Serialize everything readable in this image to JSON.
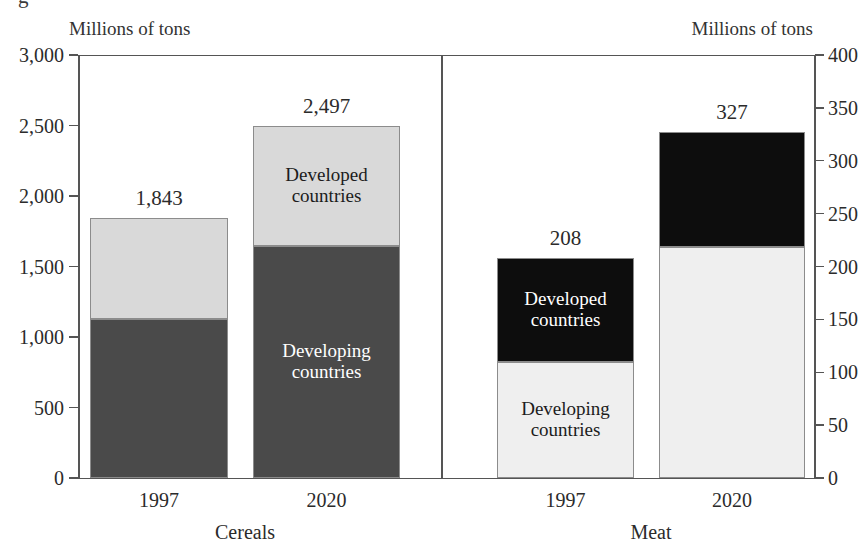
{
  "figure": {
    "top_cropped_text": "g",
    "background": "#ffffff"
  },
  "axes": {
    "left": {
      "unit_caption": "Millions of tons",
      "min": 0,
      "max": 3000,
      "ticks": [
        0,
        500,
        1000,
        1500,
        2000,
        2500,
        3000
      ],
      "tick_labels": [
        "0",
        "500",
        "1,000",
        "1,500",
        "2,000",
        "2,500",
        "3,000"
      ]
    },
    "right": {
      "unit_caption": "Millions of tons",
      "min": 0,
      "max": 400,
      "ticks": [
        0,
        50,
        100,
        150,
        200,
        250,
        300,
        350,
        400
      ],
      "tick_labels": [
        "0",
        "50",
        "100",
        "150",
        "200",
        "250",
        "300",
        "350",
        "400"
      ]
    }
  },
  "colors": {
    "cereals_developing": "#4a4a4a",
    "cereals_developed": "#d9d9d9",
    "meat_developing": "#efefef",
    "meat_developed": "#0d0d0d",
    "axis": "#555555",
    "text": "#2b2b2b"
  },
  "chart_data": {
    "type": "bar",
    "subtype": "stacked",
    "title": "",
    "xlabel": "",
    "ylabel": "Millions of tons",
    "panels": [
      {
        "name": "Cereals",
        "group_label": "Cereals",
        "axis": "left",
        "ylim": [
          0,
          3000
        ],
        "categories": [
          "1997",
          "2020"
        ],
        "totals": [
          1843,
          2497
        ],
        "total_labels": [
          "1,843",
          "2,497"
        ],
        "series": [
          {
            "name": "Developing countries",
            "values": [
              1130,
              1645
            ],
            "color": "#4a4a4a",
            "label_color": "#ffffff"
          },
          {
            "name": "Developed countries",
            "values": [
              713,
              852
            ],
            "color": "#d9d9d9",
            "label_color": "#1c1c1c"
          }
        ],
        "annotations": [
          {
            "text_line1": "Developed",
            "text_line2": "countries",
            "on_category": "2020",
            "on_series": "Developed countries"
          },
          {
            "text_line1": "Developing",
            "text_line2": "countries",
            "on_category": "2020",
            "on_series": "Developing countries"
          }
        ]
      },
      {
        "name": "Meat",
        "group_label": "Meat",
        "axis": "right",
        "ylim": [
          0,
          400
        ],
        "categories": [
          "1997",
          "2020"
        ],
        "totals": [
          208,
          327
        ],
        "total_labels": [
          "208",
          "327"
        ],
        "series": [
          {
            "name": "Developing countries",
            "values": [
              110,
              218
            ],
            "color": "#efefef",
            "label_color": "#1c1c1c"
          },
          {
            "name": "Developed countries",
            "values": [
              98,
              109
            ],
            "color": "#0d0d0d",
            "label_color": "#ffffff"
          }
        ],
        "annotations": [
          {
            "text_line1": "Developed",
            "text_line2": "countries",
            "on_category": "1997",
            "on_series": "Developed countries"
          },
          {
            "text_line1": "Developing",
            "text_line2": "countries",
            "on_category": "1997",
            "on_series": "Developing countries"
          }
        ]
      }
    ],
    "grid": false,
    "legend": "inline-annotations"
  }
}
